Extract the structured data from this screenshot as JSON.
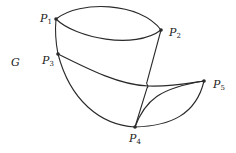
{
  "graph": {
    "name": "G",
    "vertices": [
      {
        "id": "P1",
        "base": "P",
        "sub": "1",
        "x": 56,
        "y": 19
      },
      {
        "id": "P2",
        "base": "P",
        "sub": "2",
        "x": 161,
        "y": 30
      },
      {
        "id": "P3",
        "base": "P",
        "sub": "3",
        "x": 58,
        "y": 54
      },
      {
        "id": "P4",
        "base": "P",
        "sub": "4",
        "x": 135,
        "y": 127
      },
      {
        "id": "P5",
        "base": "P",
        "sub": "5",
        "x": 204,
        "y": 81
      }
    ],
    "edges": [
      {
        "from": "P1",
        "to": "P2",
        "style": "upper arc"
      },
      {
        "from": "P1",
        "to": "P2",
        "style": "lower arc"
      },
      {
        "from": "P1",
        "to": "P3",
        "style": "straight"
      },
      {
        "from": "P2",
        "to": "P4",
        "style": "straight with crossing hop"
      },
      {
        "from": "P3",
        "to": "P5",
        "style": "curve"
      },
      {
        "from": "P3",
        "to": "P4",
        "style": "arc"
      },
      {
        "from": "P4",
        "to": "P5",
        "style": "inner arc"
      },
      {
        "from": "P4",
        "to": "P5",
        "style": "outer arc"
      }
    ],
    "colors": {
      "stroke": "#2a2a2a",
      "background": "#ffffff"
    }
  }
}
